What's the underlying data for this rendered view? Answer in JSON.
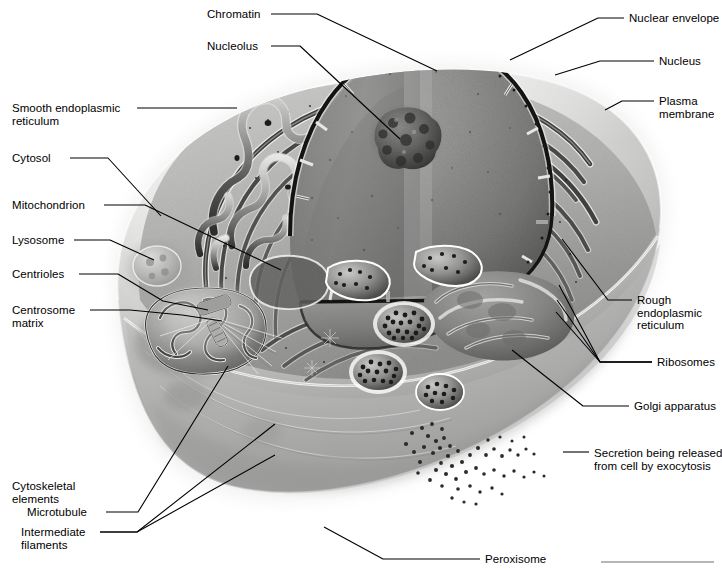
{
  "figure": {
    "width": 722,
    "height": 572,
    "background_color": "#ffffff",
    "line_color": "#000000",
    "text_color": "#000000"
  },
  "labels": [
    {
      "id": "chromatin",
      "text": "Chromatin",
      "x": 207,
      "y": 8,
      "side": "left",
      "lines": [
        "Chromatin"
      ]
    },
    {
      "id": "nucleolus",
      "text": "Nucleolus",
      "x": 207,
      "y": 40,
      "side": "left",
      "lines": [
        "Nucleolus"
      ]
    },
    {
      "id": "smooth-er",
      "text": "Smooth endoplasmic reticulum",
      "x": 12,
      "y": 102,
      "side": "left",
      "lines": [
        "Smooth endoplasmic",
        "reticulum"
      ]
    },
    {
      "id": "cytosol",
      "text": "Cytosol",
      "x": 12,
      "y": 152,
      "side": "left",
      "lines": [
        "Cytosol"
      ]
    },
    {
      "id": "mitochondrion",
      "text": "Mitochondrion",
      "x": 12,
      "y": 199,
      "side": "left",
      "lines": [
        "Mitochondrion"
      ]
    },
    {
      "id": "lysosome",
      "text": "Lysosome",
      "x": 12,
      "y": 234,
      "side": "left",
      "lines": [
        "Lysosome"
      ]
    },
    {
      "id": "centrioles",
      "text": "Centrioles",
      "x": 12,
      "y": 268,
      "side": "left",
      "lines": [
        "Centrioles"
      ]
    },
    {
      "id": "centrosome-matrix",
      "text": "Centrosome matrix",
      "x": 12,
      "y": 304,
      "side": "left",
      "lines": [
        "Centrosome",
        "matrix"
      ]
    },
    {
      "id": "cytoskeletal-elements",
      "text": "Cytoskeletal elements",
      "x": 12,
      "y": 480,
      "side": "left",
      "lines": [
        "Cytoskeletal",
        "elements"
      ]
    },
    {
      "id": "microtubule",
      "text": "Microtubule",
      "x": 27,
      "y": 506,
      "side": "left",
      "lines": [
        "Microtubule"
      ]
    },
    {
      "id": "intermediate-filaments",
      "text": "Intermediate filaments",
      "x": 21,
      "y": 526,
      "side": "left",
      "lines": [
        "Intermediate",
        "filaments"
      ]
    },
    {
      "id": "nuclear-envelope",
      "text": "Nuclear envelope",
      "x": 629,
      "y": 12,
      "side": "right",
      "lines": [
        "Nuclear envelope"
      ]
    },
    {
      "id": "nucleus",
      "text": "Nucleus",
      "x": 659,
      "y": 55,
      "side": "right",
      "lines": [
        "Nucleus"
      ]
    },
    {
      "id": "plasma-membrane",
      "text": "Plasma membrane",
      "x": 659,
      "y": 95,
      "side": "right",
      "lines": [
        "Plasma",
        "membrane"
      ]
    },
    {
      "id": "rough-er",
      "text": "Rough endoplasmic reticulum",
      "x": 637,
      "y": 294,
      "side": "right",
      "lines": [
        "Rough",
        "endoplasmic",
        "reticulum"
      ]
    },
    {
      "id": "ribosomes",
      "text": "Ribosomes",
      "x": 657,
      "y": 356,
      "side": "right",
      "lines": [
        "Ribosomes"
      ]
    },
    {
      "id": "golgi-apparatus",
      "text": "Golgi apparatus",
      "x": 634,
      "y": 400,
      "side": "right",
      "lines": [
        "Golgi apparatus"
      ]
    },
    {
      "id": "secretion-exocytosis",
      "text": "Secretion being released from cell by exocytosis",
      "x": 594,
      "y": 447,
      "side": "right",
      "lines": [
        "Secretion being released",
        "from cell by exocytosis"
      ]
    },
    {
      "id": "peroxisome",
      "text": "Peroxisome",
      "x": 485,
      "y": 553,
      "side": "right",
      "lines": [
        "Peroxisome"
      ]
    }
  ],
  "leaders": [
    {
      "id": "leader-chromatin",
      "points": "271,14 317,14 437,71"
    },
    {
      "id": "leader-nucleolus",
      "points": "271,46 300,46 400,139"
    },
    {
      "id": "leader-smooth-er",
      "points": "137,108 237,108"
    },
    {
      "id": "leader-cytosol",
      "points": "70,158 108,158 161,216"
    },
    {
      "id": "leader-mitochondrion",
      "points": "104,205 145,205 281,270"
    },
    {
      "id": "leader-lysosome",
      "points": "74,240 110,240 154,260"
    },
    {
      "id": "leader-centrioles",
      "points": "79,274 118,274 163,301 208,310"
    },
    {
      "id": "leader-centrosome-matrix",
      "points": "90,310 130,310 182,315 222,321"
    },
    {
      "id": "leader-microtubule",
      "points": "106,512 138,512 228,366"
    },
    {
      "id": "leader-intermediate-1",
      "points": "100,532 137,532 275,424"
    },
    {
      "id": "leader-intermediate-2",
      "points": "100,532 137,532 275,455"
    },
    {
      "id": "leader-nuclear-envelope",
      "points": "624,18 598,18 510,60"
    },
    {
      "id": "leader-nucleus",
      "points": "654,61 600,61 555,75"
    },
    {
      "id": "leader-plasma-membrane",
      "points": "654,101 622,101 605,110"
    },
    {
      "id": "leader-rough-er",
      "points": "632,300 608,300 562,239"
    },
    {
      "id": "leader-ribosomes-a",
      "points": "652,362 600,362 559,285"
    },
    {
      "id": "leader-ribosomes-b",
      "points": "652,362 600,362 557,300"
    },
    {
      "id": "leader-ribosomes-c",
      "points": "652,362 600,362 556,312"
    },
    {
      "id": "leader-golgi",
      "points": "629,406 583,406 512,350"
    },
    {
      "id": "leader-secretion",
      "points": "589,452 563,452"
    },
    {
      "id": "leader-peroxisome",
      "points": "480,559 383,559 324,527"
    }
  ],
  "scale_bar": {
    "id": "bottom-rule",
    "x": 601,
    "y": 561,
    "width": 113,
    "height": 2,
    "color": "#b6b6b6"
  },
  "structures": [
    {
      "id": "plasma-membrane-body",
      "name": "plasma membrane outer body"
    },
    {
      "id": "nucleus-dome",
      "name": "nucleus cutaway dome"
    },
    {
      "id": "nucleolus-blob",
      "name": "nucleolus"
    },
    {
      "id": "nuclear-envelope-rim",
      "name": "nuclear envelope with pores"
    },
    {
      "id": "rough-er-stacks",
      "name": "rough endoplasmic reticulum cisternae"
    },
    {
      "id": "smooth-er-tubules",
      "name": "smooth endoplasmic reticulum tubular network"
    },
    {
      "id": "golgi-stack",
      "name": "golgi apparatus stack"
    },
    {
      "id": "mitochondrion-body",
      "name": "mitochondrion with cristae"
    },
    {
      "id": "lysosome-body",
      "name": "lysosome"
    },
    {
      "id": "centriole-pair",
      "name": "centriole pair in centrosome matrix"
    },
    {
      "id": "peroxisome-body",
      "name": "peroxisome"
    },
    {
      "id": "secretory-vesicles",
      "name": "secretory vesicles with granules"
    },
    {
      "id": "exocytosis-granules",
      "name": "secreted granules outside cell"
    },
    {
      "id": "cytoskeleton-fibers",
      "name": "cytoskeletal microtubules and intermediate filaments"
    }
  ]
}
